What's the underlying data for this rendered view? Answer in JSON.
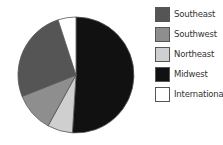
{
  "chart_data": {
    "type": "pie",
    "title": "",
    "categories": [
      "Midwest",
      "Northeast",
      "Southwest",
      "Southeast",
      "International"
    ],
    "values": [
      51,
      7,
      11,
      26,
      5
    ],
    "unit": "%",
    "start_angle_deg": 0,
    "direction": "clockwise",
    "colors": {
      "Midwest": "#111111",
      "Northeast": "#cfcfcf",
      "Southwest": "#8e8e8e",
      "Southeast": "#555555",
      "International": "#ffffff"
    },
    "legend_position": "right",
    "legend_order": [
      "Southeast",
      "Southwest",
      "Northeast",
      "Midwest",
      "International"
    ]
  },
  "legend": {
    "items": [
      {
        "label": "Southeast",
        "color": "#555555"
      },
      {
        "label": "Southwest",
        "color": "#8e8e8e"
      },
      {
        "label": "Northeast",
        "color": "#cfcfcf"
      },
      {
        "label": "Midwest",
        "color": "#111111"
      },
      {
        "label": "International",
        "color": "#ffffff"
      }
    ]
  }
}
